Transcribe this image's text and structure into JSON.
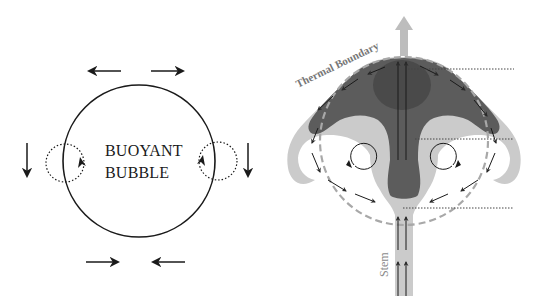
{
  "diagram": {
    "left_panel": {
      "title_line1": "BUOYANT",
      "title_line2": "BUBBLE",
      "elements": {
        "bubble": "solid circle outline",
        "top_arrows": [
          "arrow-left",
          "arrow-right"
        ],
        "bottom_arrows": [
          "arrow-right",
          "arrow-left"
        ],
        "side_arrows": [
          "arrow-down",
          "arrow-down"
        ],
        "vortices": [
          "dotted circulation loop left",
          "dotted circulation loop right"
        ]
      }
    },
    "right_panel": {
      "boundary_label": "Thermal Boundary",
      "stem_label": "Stem",
      "elements": {
        "rise_arrow": "arrow-up",
        "boundary": "dashed circle",
        "core": "dark mushroom cap",
        "halo": "light gray plume",
        "vortices": [
          "clockwise loop left",
          "counter-clockwise loop right"
        ],
        "reference_lines": 3
      }
    },
    "colors": {
      "ink": "#1a1a1a",
      "dark_core": "#5a5a5a",
      "darkest_core": "#4a4a4a",
      "light_plume": "#c8c8c8",
      "boundary_dash": "#a8a8a8",
      "label_gray": "#777777",
      "background": "#ffffff"
    }
  }
}
